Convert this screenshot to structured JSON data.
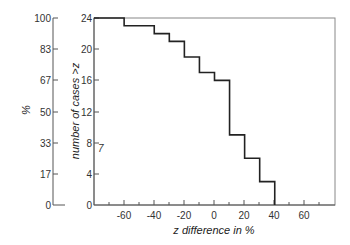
{
  "chart_data": {
    "type": "line",
    "subtype": "step",
    "title": "",
    "xlabel": "z difference in %",
    "ylabel": "number of cases >z",
    "y2label": "%",
    "xlim": [
      -80,
      80
    ],
    "ylim": [
      0,
      24
    ],
    "x_ticks": [
      -60,
      -40,
      -20,
      0,
      20,
      40,
      60
    ],
    "x_minor_step": 10,
    "y_ticks": [
      0,
      4,
      8,
      12,
      16,
      20,
      24
    ],
    "y_pct_ticks": [
      0,
      17,
      33,
      50,
      67,
      83,
      100
    ],
    "grid": false,
    "legend": null,
    "annotations": [
      "7"
    ],
    "series": [
      {
        "name": "number of cases > z",
        "x": [
          -80,
          -60,
          -40,
          -30,
          -20,
          -10,
          0,
          10,
          20,
          30,
          40
        ],
        "values": [
          24,
          23,
          22,
          21,
          19,
          17,
          16,
          9,
          6,
          3,
          0
        ]
      }
    ]
  },
  "labels": {
    "xlabel": "z difference in %",
    "ylabel": "number of cases >z",
    "pct_label": "%",
    "stray_mark": "7",
    "x_ticks": [
      "-60",
      "-40",
      "-20",
      "0",
      "20",
      "40",
      "60"
    ],
    "y_ticks": [
      "0",
      "4",
      "8",
      "12",
      "16",
      "20",
      "24"
    ],
    "pct_ticks": [
      "0",
      "17",
      "33",
      "50",
      "67",
      "83",
      "100"
    ]
  }
}
